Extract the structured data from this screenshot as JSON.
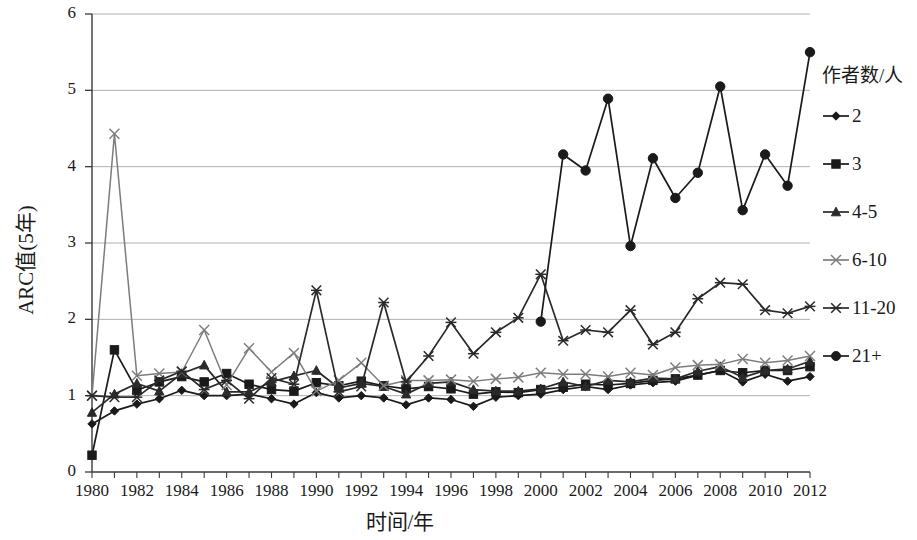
{
  "chart_data": {
    "type": "line",
    "title": "",
    "xlabel": "时间/年",
    "ylabel": "ARC值(5年)",
    "legend_title": "作者数/人",
    "legend_position": "right",
    "grid": true,
    "xlim": [
      1980,
      2012
    ],
    "ylim": [
      0,
      6
    ],
    "ytick_values": [
      0,
      1,
      2,
      3,
      4,
      5,
      6
    ],
    "ytick_labels": [
      "0",
      "1",
      "2",
      "3",
      "4",
      "5",
      "6"
    ],
    "xtick_values": [
      1980,
      1982,
      1984,
      1986,
      1988,
      1990,
      1992,
      1994,
      1996,
      1998,
      2000,
      2002,
      2004,
      2006,
      2008,
      2010,
      2012
    ],
    "xtick_labels": [
      "1980",
      "1982",
      "1984",
      "1986",
      "1988",
      "1990",
      "1992",
      "1994",
      "1996",
      "1998",
      "2000",
      "2002",
      "2004",
      "2006",
      "2008",
      "2010",
      "2012"
    ],
    "x": [
      1980,
      1981,
      1982,
      1983,
      1984,
      1985,
      1986,
      1987,
      1988,
      1989,
      1990,
      1991,
      1992,
      1993,
      1994,
      1995,
      1996,
      1997,
      1998,
      1999,
      2000,
      2001,
      2002,
      2003,
      2004,
      2005,
      2006,
      2007,
      2008,
      2009,
      2010,
      2011,
      2012
    ],
    "series": [
      {
        "name": "2",
        "marker": "diamond",
        "color": "#1a1a1a",
        "values": [
          0.63,
          0.8,
          0.89,
          0.96,
          1.07,
          1.0,
          1.0,
          1.02,
          0.96,
          0.89,
          1.04,
          0.97,
          1.0,
          0.97,
          0.88,
          0.97,
          0.95,
          0.86,
          0.98,
          1.0,
          1.02,
          1.08,
          1.12,
          1.08,
          1.14,
          1.17,
          1.19,
          1.27,
          1.33,
          1.18,
          1.28,
          1.19,
          1.25
        ]
      },
      {
        "name": "3",
        "marker": "square",
        "color": "#1a1a1a",
        "values": [
          0.22,
          1.6,
          1.07,
          1.18,
          1.25,
          1.18,
          1.29,
          1.15,
          1.08,
          1.06,
          1.17,
          1.13,
          1.19,
          1.13,
          1.09,
          1.12,
          1.09,
          1.02,
          1.05,
          1.04,
          1.08,
          1.11,
          1.15,
          1.14,
          1.16,
          1.2,
          1.22,
          1.27,
          1.33,
          1.3,
          1.33,
          1.33,
          1.38
        ]
      },
      {
        "name": "4-5",
        "marker": "triangle",
        "color": "#2a2a2a",
        "values": [
          0.78,
          1.02,
          1.16,
          1.06,
          1.29,
          1.4,
          1.05,
          1.05,
          1.18,
          1.26,
          1.33,
          1.1,
          1.16,
          1.12,
          1.02,
          1.16,
          1.18,
          1.08,
          1.06,
          1.06,
          1.09,
          1.18,
          1.12,
          1.2,
          1.18,
          1.23,
          1.22,
          1.32,
          1.38,
          1.24,
          1.33,
          1.35,
          1.45
        ]
      },
      {
        "name": "6-10",
        "marker": "x",
        "color": "#7d7d7d",
        "values": [
          1.0,
          4.43,
          1.26,
          1.29,
          1.31,
          1.86,
          1.14,
          1.62,
          1.31,
          1.56,
          1.06,
          1.2,
          1.43,
          1.13,
          1.2,
          1.2,
          1.21,
          1.19,
          1.22,
          1.24,
          1.3,
          1.28,
          1.28,
          1.25,
          1.3,
          1.27,
          1.37,
          1.4,
          1.41,
          1.48,
          1.43,
          1.46,
          1.52
        ]
      },
      {
        "name": "11-20",
        "marker": "star",
        "color": "#2a2a2a",
        "values": [
          1.0,
          0.98,
          0.98,
          1.2,
          1.32,
          1.08,
          1.2,
          0.96,
          1.23,
          1.15,
          2.38,
          1.05,
          1.12,
          2.22,
          1.18,
          1.52,
          1.96,
          1.55,
          1.83,
          2.02,
          2.59,
          1.72,
          1.86,
          1.83,
          2.12,
          1.67,
          1.83,
          2.27,
          2.48,
          2.46,
          2.12,
          2.08,
          2.17
        ]
      },
      {
        "name": "21+",
        "marker": "circle",
        "color": "#1a1a1a",
        "values": [
          null,
          null,
          null,
          null,
          null,
          null,
          null,
          null,
          null,
          null,
          null,
          null,
          null,
          null,
          null,
          null,
          null,
          null,
          null,
          null,
          1.97,
          4.16,
          3.95,
          4.89,
          2.96,
          4.11,
          3.59,
          3.92,
          5.05,
          3.43,
          4.16,
          3.75,
          5.5
        ]
      }
    ]
  }
}
